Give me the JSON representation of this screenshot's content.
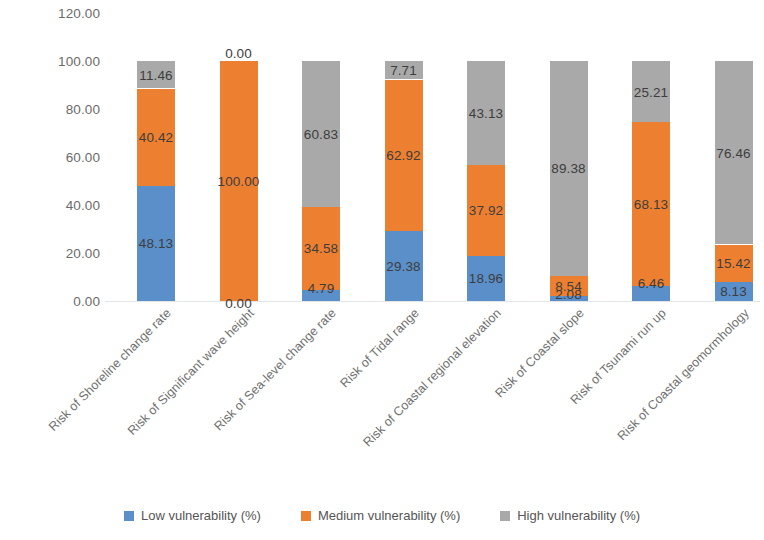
{
  "chart_data": {
    "type": "bar",
    "subtype": "stacked-bar",
    "title": "",
    "xlabel": "",
    "ylabel": "",
    "ylim": [
      0,
      120
    ],
    "ytick_step": 20,
    "ytick_labels": [
      "0.00",
      "20.00",
      "40.00",
      "60.00",
      "80.00",
      "100.00",
      "120.00"
    ],
    "ytick_values": [
      0,
      20,
      40,
      60,
      80,
      100,
      120
    ],
    "grid": false,
    "legend_position": "bottom",
    "categories": [
      "Risk of Shoreline change rate",
      "Risk of Significant wave height",
      "Risk of Sea-level change rate",
      "Risk of Tidal range",
      "Risk of Coastal regional elevation",
      "Risk of Coastal slope",
      "Risk of Tsunami run up",
      "Risk of Coastal geomormhology"
    ],
    "series": [
      {
        "name": "Low vulnerability (%)",
        "color": "#5b8fc9",
        "values": [
          48.13,
          0.0,
          4.79,
          29.38,
          18.96,
          2.08,
          6.46,
          8.13
        ],
        "labels": [
          "48.13",
          "0.00",
          "4.79",
          "29.38",
          "18.96",
          "2.08",
          "6.46",
          "8.13"
        ]
      },
      {
        "name": "Medium vulnerability (%)",
        "color": "#ed8030",
        "values": [
          40.42,
          100.0,
          34.58,
          62.92,
          37.92,
          8.54,
          68.13,
          15.42
        ],
        "labels": [
          "40.42",
          "100.00",
          "34.58",
          "62.92",
          "37.92",
          "8.54",
          "68.13",
          "15.42"
        ]
      },
      {
        "name": "High vulnerability (%)",
        "color": "#a9a9a9",
        "values": [
          11.46,
          0.0,
          60.83,
          7.71,
          43.13,
          89.38,
          25.21,
          76.46
        ],
        "labels": [
          "11.46",
          "0.00",
          "60.83",
          "7.71",
          "43.13",
          "89.38",
          "25.21",
          "76.46"
        ]
      }
    ],
    "legend": [
      {
        "label": "Low vulnerability (%)",
        "color": "#5b8fc9"
      },
      {
        "label": "Medium vulnerability (%)",
        "color": "#ed8030"
      },
      {
        "label": "High vulnerability (%)",
        "color": "#a9a9a9"
      }
    ]
  }
}
